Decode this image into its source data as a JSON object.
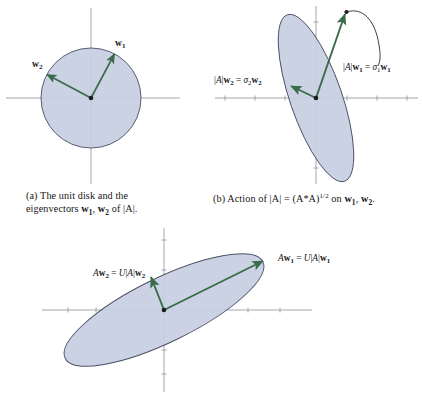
{
  "figure": {
    "colors": {
      "ellipse_fill": "#c6cee2",
      "ellipse_stroke": "#4a4f63",
      "vector_arrow": "#3a6b4a",
      "axis": "#9a9ba6",
      "text": "#161616",
      "background": "#ffffff"
    },
    "panels": [
      {
        "id": "a",
        "shape": "circle",
        "shape_label": "unit-disk",
        "vectors": [
          {
            "name": "w1",
            "label": "w₁",
            "label_text": "w",
            "sub": "1",
            "angle_deg": 62,
            "length": 50
          },
          {
            "name": "w2",
            "label": "w₂",
            "label_text": "w",
            "sub": "2",
            "angle_deg": 152,
            "length": 50
          }
        ],
        "caption": {
          "line1": "(a) The unit disk and the",
          "line2_pre": "eigenvectors ",
          "line2_v1": "w",
          "line2_v1sub": "1",
          "line2_mid": ", ",
          "line2_v2": "w",
          "line2_v2sub": "2",
          "line2_post": " of |A|."
        }
      },
      {
        "id": "b",
        "shape": "ellipse",
        "shape_label": "stretched-disk",
        "labels": [
          {
            "name": "sigma1-label",
            "text": "|A|w₁ = σ₁w₁"
          },
          {
            "name": "sigma2-label",
            "text": "|A|w₂ = σ₂w₂"
          }
        ],
        "caption": {
          "pre": "(b) Action of |A| = (A*A)",
          "exp": "1/2",
          "post_pre": " on ",
          "v1": "w",
          "v1sub": "1",
          "mid": ", ",
          "v2": "w",
          "v2sub": "2",
          "post": "."
        }
      },
      {
        "id": "c",
        "shape": "ellipse",
        "shape_label": "rotated-stretched-disk",
        "labels": [
          {
            "name": "aw1-label",
            "text": "Aw₁ = U|A|w₁"
          },
          {
            "name": "aw2-label",
            "text": "Aw₂ = U|A|w₂"
          }
        ],
        "caption_partial": ""
      }
    ]
  }
}
